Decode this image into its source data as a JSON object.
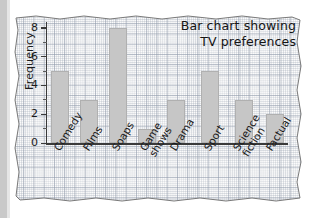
{
  "chart_data": {
    "type": "bar",
    "title": "Bar chart showing TV preferences",
    "title_lines": [
      "Bar chart showing",
      "TV preferences"
    ],
    "xlabel": "",
    "ylabel": "Frequency",
    "categories": [
      "Comedy",
      "Films",
      "Soaps",
      "Game shows",
      "Drama",
      "Sport",
      "Science fiction",
      "Factual"
    ],
    "category_lines": [
      [
        "Comedy"
      ],
      [
        "Films"
      ],
      [
        "Soaps"
      ],
      [
        "Game",
        "shows"
      ],
      [
        "Drama"
      ],
      [
        "Sport"
      ],
      [
        "Science",
        "fiction"
      ],
      [
        "Factual"
      ]
    ],
    "values": [
      5,
      3,
      8,
      1,
      3,
      5,
      3,
      2
    ],
    "ylim": [
      0,
      8.4
    ],
    "ytick_labels": [
      "0",
      "2",
      "4",
      "6",
      "8"
    ],
    "ytick_values": [
      0,
      2,
      4,
      6,
      8
    ],
    "yminor_values": [
      1,
      3,
      5,
      7
    ],
    "grid": "graph-paper",
    "legend": null,
    "bar_color": "#c6c6c6",
    "bar_edge_color": "#b0b0b0",
    "axis_color": "#3a3a3a",
    "paper_color": "#fbfbfb",
    "grid_color": "#8c96a8"
  }
}
